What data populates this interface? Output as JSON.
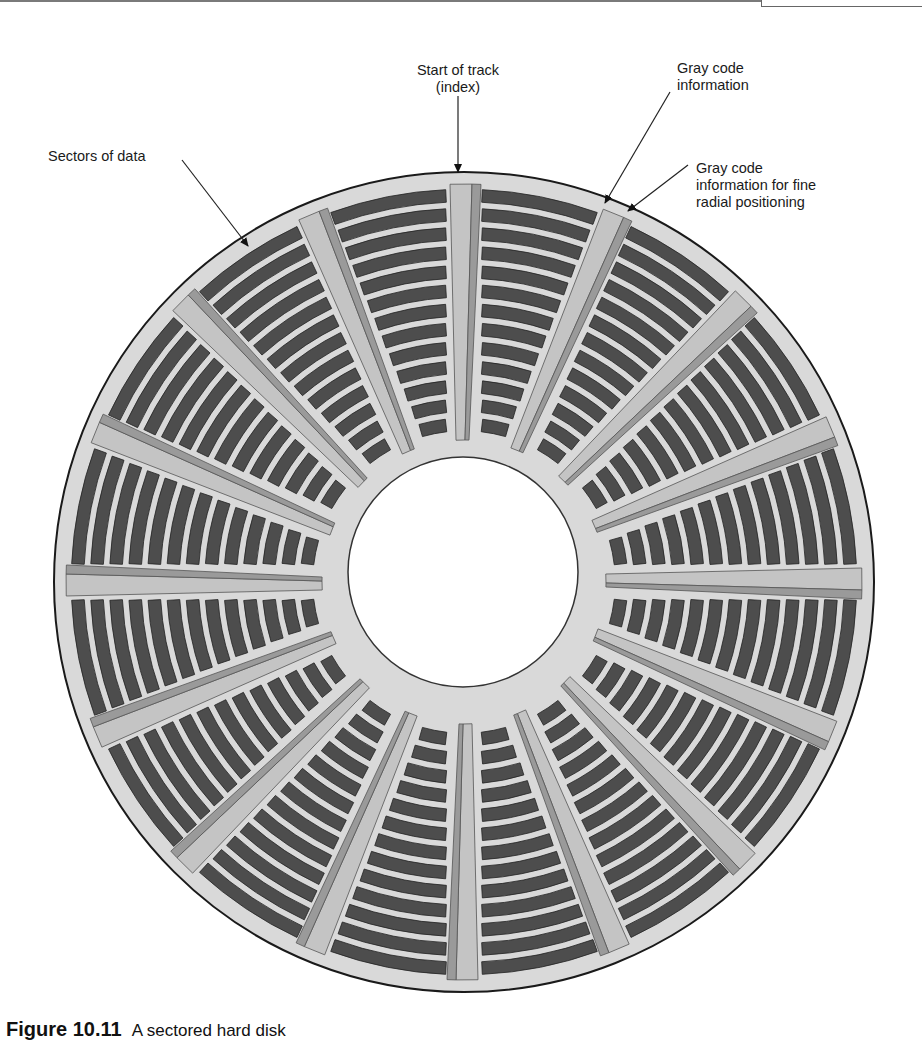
{
  "figure": {
    "caption_number": "Figure 10.11",
    "caption_text": "A sectored hard disk"
  },
  "labels": {
    "start_of_track": "Start of track\n(index)",
    "gray_code": "Gray code\ninformation",
    "gray_code_fine": "Gray code\ninformation for fine\nradial positioning",
    "sectors_of_data": "Sectors of data"
  },
  "disk": {
    "center_x": 464,
    "center_y": 582,
    "outer_radius": 410,
    "hole_radius": 115,
    "track_inner_radius": 148,
    "track_outer_radius": 396,
    "wedge_count": 16,
    "tracks_per_sector": 13,
    "colors": {
      "platter": "#d9d9d9",
      "outline": "#1a1a1a",
      "track": "#4d4d4d",
      "track_edge": "#222222",
      "wedge_light": "#c4c4c4",
      "wedge_medium": "#9a9a9a",
      "hole": "#ffffff"
    }
  }
}
